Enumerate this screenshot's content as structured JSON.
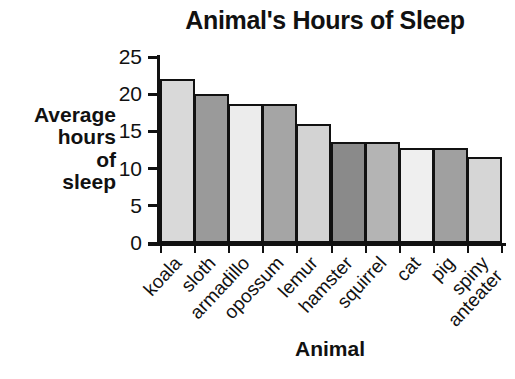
{
  "chart_data": {
    "type": "bar",
    "title": "Animal's Hours of Sleep",
    "xlabel": "Animal",
    "ylabel": "Average hours of sleep",
    "ylabel_lines": [
      "Average",
      "hours",
      "of",
      "sleep"
    ],
    "categories": [
      "koala",
      "sloth",
      "armadillo",
      "opossum",
      "lemur",
      "hamster",
      "squirrel",
      "cat",
      "pig",
      "spiny anteater"
    ],
    "category_lines": [
      [
        "koala"
      ],
      [
        "sloth"
      ],
      [
        "armadillo"
      ],
      [
        "opossum"
      ],
      [
        "lemur"
      ],
      [
        "hamster"
      ],
      [
        "squirrel"
      ],
      [
        "cat"
      ],
      [
        "pig"
      ],
      [
        "spiny",
        "anteater"
      ]
    ],
    "values": [
      22,
      20,
      18.7,
      18.7,
      16,
      13.6,
      13.6,
      12.8,
      12.8,
      11.5
    ],
    "ylim": [
      0,
      25
    ],
    "yticks": [
      0,
      5,
      10,
      15,
      20,
      25
    ],
    "ytick_labels": [
      "0",
      "5",
      "10",
      "15",
      "20",
      "25"
    ],
    "grid": false,
    "legend": "none",
    "bar_colors": [
      "#d9d9d9",
      "#9a9a9a",
      "#ececec",
      "#a5a5a5",
      "#d3d3d3",
      "#8a8a8a",
      "#b4b4b4",
      "#efefef",
      "#a0a0a0",
      "#d6d6d6"
    ],
    "bar_edge_color": "#111111",
    "axis_color": "#111111",
    "background_color": "#ffffff"
  }
}
